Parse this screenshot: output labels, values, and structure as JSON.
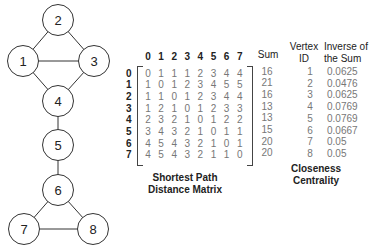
{
  "graph": {
    "nodes": [
      {
        "id": "1",
        "x": 23,
        "y": 61
      },
      {
        "id": "2",
        "x": 58,
        "y": 20
      },
      {
        "id": "3",
        "x": 94,
        "y": 61
      },
      {
        "id": "4",
        "x": 58,
        "y": 101
      },
      {
        "id": "5",
        "x": 58,
        "y": 145
      },
      {
        "id": "6",
        "x": 58,
        "y": 190
      },
      {
        "id": "7",
        "x": 24,
        "y": 229
      },
      {
        "id": "8",
        "x": 93,
        "y": 229
      }
    ],
    "edges": [
      [
        "1",
        "2"
      ],
      [
        "2",
        "3"
      ],
      [
        "1",
        "3"
      ],
      [
        "1",
        "4"
      ],
      [
        "3",
        "4"
      ],
      [
        "4",
        "5"
      ],
      [
        "5",
        "6"
      ],
      [
        "6",
        "7"
      ],
      [
        "6",
        "8"
      ],
      [
        "7",
        "8"
      ]
    ]
  },
  "matrix": {
    "column_headers": [
      "0",
      "1",
      "2",
      "3",
      "4",
      "5",
      "6",
      "7"
    ],
    "row_headers": [
      "0",
      "1",
      "2",
      "3",
      "4",
      "5",
      "6",
      "7"
    ],
    "rows": [
      [
        "0",
        "1",
        "1",
        "1",
        "2",
        "3",
        "4",
        "4"
      ],
      [
        "1",
        "0",
        "1",
        "2",
        "3",
        "4",
        "5",
        "5"
      ],
      [
        "1",
        "1",
        "0",
        "1",
        "2",
        "3",
        "4",
        "4"
      ],
      [
        "1",
        "2",
        "1",
        "0",
        "1",
        "2",
        "3",
        "3"
      ],
      [
        "2",
        "3",
        "2",
        "1",
        "0",
        "1",
        "2",
        "2"
      ],
      [
        "3",
        "4",
        "3",
        "2",
        "1",
        "0",
        "1",
        "1"
      ],
      [
        "4",
        "5",
        "4",
        "3",
        "2",
        "1",
        "0",
        "1"
      ],
      [
        "4",
        "5",
        "4",
        "3",
        "2",
        "1",
        "1",
        "0"
      ]
    ],
    "sum_header": "Sum",
    "sums": [
      "16",
      "21",
      "16",
      "13",
      "13",
      "15",
      "20",
      "20"
    ],
    "caption_line1": "Shortest Path",
    "caption_line2": "Distance Matrix"
  },
  "centrality": {
    "vertex_header_line1": "Vertex",
    "vertex_header_line2": "ID",
    "inverse_header_line1": "Inverse of",
    "inverse_header_line2": "the Sum",
    "vertex_ids": [
      "1",
      "2",
      "3",
      "4",
      "5",
      "6",
      "7",
      "8"
    ],
    "inverse_values": [
      "0.0625",
      "0.0476",
      "0.0625",
      "0.0769",
      "0.0769",
      "0.0667",
      "0.05",
      "0.05"
    ],
    "caption_line1": "Closeness",
    "caption_line2": "Centrality"
  }
}
